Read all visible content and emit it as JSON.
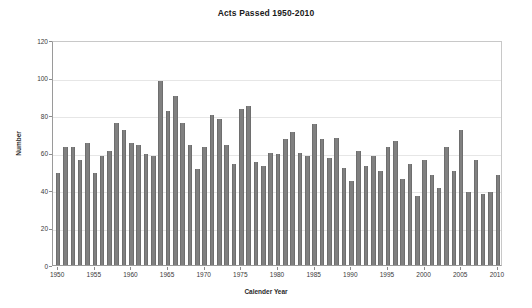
{
  "chart_data": {
    "type": "bar",
    "title": "Acts Passed 1950-2010",
    "xlabel": "Calender Year",
    "ylabel": "Number",
    "xlim": [
      1949.3,
      2010.7
    ],
    "ylim": [
      0,
      120
    ],
    "ytick_values": [
      0,
      20,
      40,
      60,
      80,
      100,
      120
    ],
    "ytick_labels": [
      "0",
      "20",
      "40",
      "60",
      "80",
      "100",
      "120"
    ],
    "xtick_values": [
      1950,
      1955,
      1960,
      1965,
      1970,
      1975,
      1980,
      1985,
      1990,
      1995,
      2000,
      2005,
      2010
    ],
    "xtick_labels": [
      "1950",
      "1955",
      "1960",
      "1965",
      "1970",
      "1975",
      "1980",
      "1985",
      "1990",
      "1995",
      "2000",
      "2005",
      "2010"
    ],
    "grid": "horizontal",
    "legend": "none",
    "bar_color": "#808080",
    "bar_edge_color": "#6e6e6e",
    "categories": [
      "1950",
      "1951",
      "1952",
      "1953",
      "1954",
      "1955",
      "1956",
      "1957",
      "1958",
      "1959",
      "1960",
      "1961",
      "1962",
      "1963",
      "1964",
      "1965",
      "1966",
      "1967",
      "1968",
      "1969",
      "1970",
      "1971",
      "1972",
      "1973",
      "1974",
      "1975",
      "1976",
      "1977",
      "1978",
      "1979",
      "1980",
      "1981",
      "1982",
      "1983",
      "1984",
      "1985",
      "1986",
      "1987",
      "1988",
      "1989",
      "1990",
      "1991",
      "1992",
      "1993",
      "1994",
      "1995",
      "1996",
      "1997",
      "1998",
      "1999",
      "2000",
      "2001",
      "2002",
      "2003",
      "2004",
      "2005",
      "2006",
      "2007",
      "2008",
      "2009",
      "2010"
    ],
    "values": [
      49,
      63,
      63,
      56,
      65,
      49,
      58,
      61,
      76,
      72,
      65,
      64,
      59,
      58,
      98,
      82,
      90,
      76,
      64,
      51,
      63,
      80,
      78,
      64,
      54,
      83,
      85,
      55,
      53,
      60,
      59,
      67,
      71,
      60,
      58,
      75,
      67,
      57,
      68,
      52,
      45,
      61,
      53,
      58,
      50,
      63,
      66,
      46,
      54,
      37,
      56,
      48,
      41,
      63,
      50,
      72,
      39,
      56,
      38,
      39,
      48
    ]
  }
}
